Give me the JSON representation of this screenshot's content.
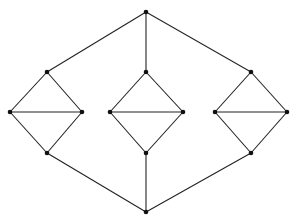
{
  "diagram": {
    "type": "graph",
    "edge_color": "#222222",
    "node_color": "#111111",
    "nodes": [
      {
        "id": "top",
        "x": 146,
        "y": 12
      },
      {
        "id": "L_top",
        "x": 47,
        "y": 72
      },
      {
        "id": "L_left",
        "x": 10,
        "y": 112
      },
      {
        "id": "L_right",
        "x": 82,
        "y": 112
      },
      {
        "id": "L_bottom",
        "x": 47,
        "y": 153
      },
      {
        "id": "M_top",
        "x": 146,
        "y": 72
      },
      {
        "id": "M_left",
        "x": 110,
        "y": 112
      },
      {
        "id": "M_right",
        "x": 183,
        "y": 112
      },
      {
        "id": "M_bottom",
        "x": 146,
        "y": 153
      },
      {
        "id": "R_top",
        "x": 251,
        "y": 72
      },
      {
        "id": "R_left",
        "x": 215,
        "y": 112
      },
      {
        "id": "R_right",
        "x": 287,
        "y": 112
      },
      {
        "id": "R_bottom",
        "x": 251,
        "y": 153
      },
      {
        "id": "bottom",
        "x": 146,
        "y": 212
      }
    ],
    "edges": [
      [
        "top",
        "L_top"
      ],
      [
        "top",
        "M_top"
      ],
      [
        "top",
        "R_top"
      ],
      [
        "L_top",
        "L_left"
      ],
      [
        "L_top",
        "L_right"
      ],
      [
        "L_left",
        "L_right"
      ],
      [
        "L_left",
        "L_bottom"
      ],
      [
        "L_right",
        "L_bottom"
      ],
      [
        "M_top",
        "M_left"
      ],
      [
        "M_top",
        "M_right"
      ],
      [
        "M_left",
        "M_right"
      ],
      [
        "M_left",
        "M_bottom"
      ],
      [
        "M_right",
        "M_bottom"
      ],
      [
        "R_top",
        "R_left"
      ],
      [
        "R_top",
        "R_right"
      ],
      [
        "R_left",
        "R_right"
      ],
      [
        "R_left",
        "R_bottom"
      ],
      [
        "R_right",
        "R_bottom"
      ],
      [
        "L_bottom",
        "bottom"
      ],
      [
        "M_bottom",
        "bottom"
      ],
      [
        "R_bottom",
        "bottom"
      ]
    ]
  }
}
